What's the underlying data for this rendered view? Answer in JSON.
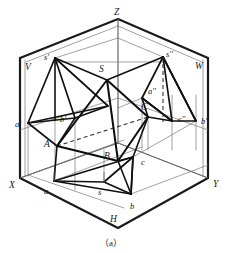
{
  "figure": {
    "caption": "（a）",
    "colors": {
      "ink": "#1a1a1a",
      "thin": "#555555",
      "hidden": "#333333",
      "background": "#ffffff"
    },
    "axis_labels": [
      {
        "id": "Z",
        "text": "Z",
        "x": 114,
        "y": 8,
        "italic": true
      },
      {
        "id": "X",
        "text": "X",
        "x": 9,
        "y": 181,
        "italic": true
      },
      {
        "id": "Y",
        "text": "Y",
        "x": 213,
        "y": 180,
        "italic": true
      },
      {
        "id": "V",
        "text": "V",
        "x": 25,
        "y": 63,
        "italic": true
      },
      {
        "id": "W",
        "text": "W",
        "x": 195,
        "y": 62,
        "italic": true
      },
      {
        "id": "H",
        "text": "H",
        "x": 110,
        "y": 215,
        "italic": true
      }
    ],
    "point_labels": [
      {
        "id": "s-prime",
        "text": "s'",
        "x": 44,
        "y": 53,
        "size": "small"
      },
      {
        "id": "s-dprime",
        "text": "s''",
        "x": 166,
        "y": 50,
        "size": "small"
      },
      {
        "id": "S",
        "text": "S",
        "x": 99,
        "y": 65,
        "size": "normal"
      },
      {
        "id": "a-prime",
        "text": "a'",
        "x": 15,
        "y": 120,
        "size": "small"
      },
      {
        "id": "b-prime",
        "text": "b'",
        "x": 60,
        "y": 115,
        "size": "small"
      },
      {
        "id": "a-dprime",
        "text": "a''",
        "x": 148,
        "y": 87,
        "size": "small"
      },
      {
        "id": "c-dprime",
        "text": "c''",
        "x": 178,
        "y": 115,
        "size": "small"
      },
      {
        "id": "b-dprime",
        "text": "b''",
        "x": 201,
        "y": 117,
        "size": "small"
      },
      {
        "id": "C",
        "text": "C",
        "x": 141,
        "y": 103,
        "size": "normal"
      },
      {
        "id": "A",
        "text": "A",
        "x": 44,
        "y": 140,
        "size": "normal"
      },
      {
        "id": "B",
        "text": "B",
        "x": 104,
        "y": 152,
        "size": "normal"
      },
      {
        "id": "c",
        "text": "c",
        "x": 141,
        "y": 158,
        "size": "small"
      },
      {
        "id": "a",
        "text": "a",
        "x": 44,
        "y": 187,
        "size": "small"
      },
      {
        "id": "s",
        "text": "s",
        "x": 98,
        "y": 188,
        "size": "small"
      },
      {
        "id": "b",
        "text": "b",
        "x": 130,
        "y": 202,
        "size": "small"
      }
    ],
    "geometry": {
      "box_outline": {
        "Z": [
          118,
          19
        ],
        "VL": [
          20,
          58
        ],
        "WR": [
          208,
          58
        ],
        "X": [
          20,
          178
        ],
        "Y": [
          208,
          178
        ],
        "H": [
          118,
          228
        ],
        "O": [
          118,
          143
        ]
      },
      "pyramid_vertices": {
        "S": [
          107,
          80
        ],
        "A": [
          57,
          146
        ],
        "B": [
          118,
          161
        ],
        "C": [
          148,
          117
        ]
      },
      "v_projection": {
        "s_prime": [
          55,
          58
        ],
        "a_prime": [
          28,
          123
        ],
        "b_prime": [
          75,
          118
        ],
        "c_prime": [
          108,
          106
        ]
      },
      "w_projection": {
        "s_dprime": [
          163,
          57
        ],
        "a_dprime": [
          142,
          98
        ],
        "c_dprime": [
          172,
          121
        ],
        "b_dprime": [
          196,
          121
        ]
      },
      "h_projection": {
        "s": [
          104,
          182
        ],
        "a": [
          54,
          181
        ],
        "b": [
          131,
          194
        ],
        "c": [
          133,
          157
        ]
      }
    }
  }
}
